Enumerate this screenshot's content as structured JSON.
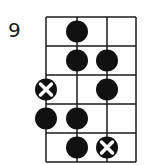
{
  "diagram": {
    "type": "fretboard-scale-diagram",
    "starting_fret_label": "9",
    "strings": 4,
    "frets": 5,
    "colors": {
      "line": "#1a1a1a",
      "dot": "#111111",
      "x_mark": "#ffffff",
      "background": "#ffffff"
    },
    "markers": [
      {
        "fret": 1,
        "string": 2,
        "type": "dot"
      },
      {
        "fret": 2,
        "string": 2,
        "type": "dot"
      },
      {
        "fret": 2,
        "string": 3,
        "type": "dot"
      },
      {
        "fret": 3,
        "string": 1,
        "type": "root-x"
      },
      {
        "fret": 3,
        "string": 3,
        "type": "dot"
      },
      {
        "fret": 4,
        "string": 1,
        "type": "dot"
      },
      {
        "fret": 4,
        "string": 2,
        "type": "dot"
      },
      {
        "fret": 5,
        "string": 2,
        "type": "dot"
      },
      {
        "fret": 5,
        "string": 3,
        "type": "root-x"
      }
    ]
  }
}
